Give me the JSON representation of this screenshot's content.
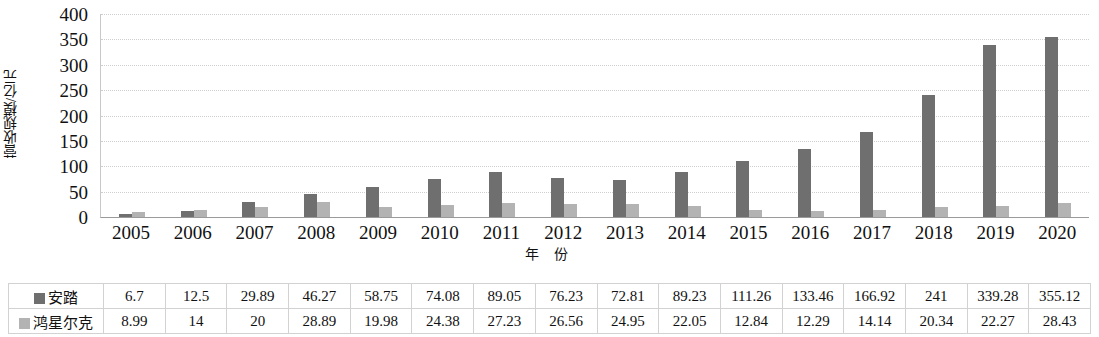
{
  "chart_data": {
    "type": "bar",
    "title": "",
    "xlabel": "年 份",
    "ylabel": "营收规模/亿元",
    "ylim": [
      0,
      400
    ],
    "yticks": [
      0,
      50,
      100,
      150,
      200,
      250,
      300,
      350,
      400
    ],
    "grid": true,
    "legend_position": "table-row-header",
    "categories": [
      "2005",
      "2006",
      "2007",
      "2008",
      "2009",
      "2010",
      "2011",
      "2012",
      "2013",
      "2014",
      "2015",
      "2016",
      "2017",
      "2018",
      "2019",
      "2020"
    ],
    "series": [
      {
        "name": "安踏",
        "color": "#6f6f6f",
        "values": [
          6.7,
          12.5,
          29.89,
          46.27,
          58.75,
          74.08,
          89.05,
          76.23,
          72.81,
          89.23,
          111.26,
          133.46,
          166.92,
          241,
          339.28,
          355.12
        ],
        "labels": [
          "6.7",
          "12.5",
          "29.89",
          "46.27",
          "58.75",
          "74.08",
          "89.05",
          "76.23",
          "72.81",
          "89.23",
          "111.26",
          "133.46",
          "166.92",
          "241",
          "339.28",
          "355.12"
        ]
      },
      {
        "name": "鸿星尔克",
        "color": "#b3b3b3",
        "values": [
          8.99,
          14,
          20,
          28.89,
          19.98,
          24.38,
          27.23,
          26.56,
          24.95,
          22.05,
          12.84,
          12.29,
          14.14,
          20.34,
          22.27,
          28.43
        ],
        "labels": [
          "8.99",
          "14",
          "20",
          "28.89",
          "19.98",
          "24.38",
          "27.23",
          "26.56",
          "24.95",
          "22.05",
          "12.84",
          "12.29",
          "14.14",
          "20.34",
          "22.27",
          "28.43"
        ]
      }
    ]
  },
  "legend": {
    "swatch_icons": [
      "legend-swatch-anta",
      "legend-swatch-hongxingerke"
    ]
  }
}
